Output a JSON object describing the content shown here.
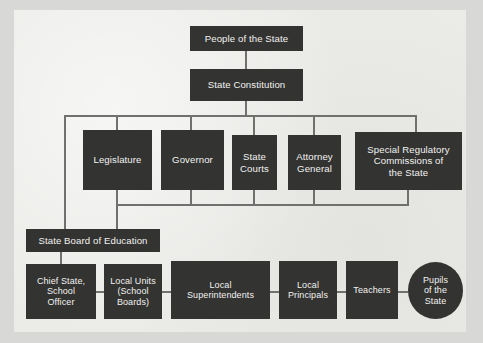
{
  "diagram": {
    "colors": {
      "page_background": "#d8d8d6",
      "panel_background": "#ebebe8",
      "node_fill": "#333331",
      "node_text": "#f2f2f0",
      "connector": "#70706e"
    },
    "nodes": [
      {
        "id": "people",
        "label": "People of the State",
        "shape": "rect"
      },
      {
        "id": "constitution",
        "label": "State Constitution",
        "shape": "rect"
      },
      {
        "id": "legislature",
        "label": "Legislature",
        "shape": "rect"
      },
      {
        "id": "governor",
        "label": "Governor",
        "shape": "rect"
      },
      {
        "id": "courts",
        "label": "State\nCourts",
        "line1": "State",
        "line2": "Courts",
        "shape": "rect"
      },
      {
        "id": "attorney",
        "label": "Attorney\nGeneral",
        "line1": "Attorney",
        "line2": "General",
        "shape": "rect"
      },
      {
        "id": "commissions",
        "label": "Special Regulatory Commissions of the State",
        "line1": "Special Regulatory",
        "line2": "Commissions of",
        "line3": "the State",
        "shape": "rect"
      },
      {
        "id": "stateboard",
        "label": "State Board of Education",
        "shape": "rect"
      },
      {
        "id": "chief",
        "label": "Chief State, School Officer",
        "line1": "Chief State,",
        "line2": "School",
        "line3": "Officer",
        "shape": "rect"
      },
      {
        "id": "localunits",
        "label": "Local Units (School Boards)",
        "line1": "Local Units",
        "line2": "(School",
        "line3": "Boards)",
        "shape": "rect"
      },
      {
        "id": "superintendents",
        "label": "Local Superintendents",
        "line1": "Local",
        "line2": "Superintendents",
        "shape": "rect"
      },
      {
        "id": "principals",
        "label": "Local Principals",
        "line1": "Local",
        "line2": "Principals",
        "shape": "rect"
      },
      {
        "id": "teachers",
        "label": "Teachers",
        "shape": "rect"
      },
      {
        "id": "pupils",
        "label": "Pupils of the State",
        "line1": "Pupils",
        "line2": "of the",
        "line3": "State",
        "shape": "ellipse"
      }
    ],
    "edges": [
      {
        "from": "people",
        "to": "constitution"
      },
      {
        "from": "constitution",
        "to": "legislature"
      },
      {
        "from": "constitution",
        "to": "governor"
      },
      {
        "from": "constitution",
        "to": "courts"
      },
      {
        "from": "constitution",
        "to": "attorney"
      },
      {
        "from": "constitution",
        "to": "commissions"
      },
      {
        "from": "legislature",
        "to": "stateboard"
      },
      {
        "from": "governor",
        "to": "stateboard"
      },
      {
        "from": "courts",
        "to": "stateboard"
      },
      {
        "from": "attorney",
        "to": "stateboard"
      },
      {
        "from": "commissions",
        "to": "stateboard"
      },
      {
        "from": "stateboard",
        "to": "chief"
      },
      {
        "from": "chief",
        "to": "localunits"
      },
      {
        "from": "localunits",
        "to": "superintendents"
      },
      {
        "from": "superintendents",
        "to": "principals"
      },
      {
        "from": "principals",
        "to": "teachers"
      },
      {
        "from": "teachers",
        "to": "pupils"
      }
    ]
  }
}
